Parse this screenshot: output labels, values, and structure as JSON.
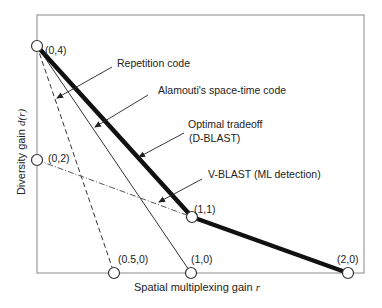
{
  "diagram": {
    "title": "",
    "x_axis_label": "Spatial multiplexing gain ",
    "x_axis_var": "r",
    "y_axis_label": "Diversity gain ",
    "y_axis_var": "d(r)",
    "points": [
      {
        "id": "p04",
        "label": "(0,4)"
      },
      {
        "id": "p02",
        "label": "(0,2)"
      },
      {
        "id": "p050",
        "label": "(0.5,0)"
      },
      {
        "id": "p10",
        "label": "(1,0)"
      },
      {
        "id": "p11",
        "label": "(1,1)"
      },
      {
        "id": "p20",
        "label": "(2,0)"
      }
    ],
    "curves": [
      {
        "name": "Repetition code",
        "style": "dashed",
        "from": "(0,4)",
        "to": "(0.5,0)"
      },
      {
        "name": "Alamouti's space-time code",
        "style": "thin-solid",
        "from": "(0,4)",
        "to": "(1,0)"
      },
      {
        "name": "Optimal tradeoff",
        "sublabel": "(D-BLAST)",
        "style": "thick-solid",
        "path": [
          "(0,4)",
          "(1,1)",
          "(2,0)"
        ]
      },
      {
        "name": "V-BLAST (ML detection)",
        "style": "dash-dot",
        "from": "(0,2)",
        "to": "(1,1)"
      }
    ],
    "annotations": {
      "repetition": "Repetition code",
      "alamouti": "Alamouti's space-time code",
      "optimal_line1": "Optimal tradeoff",
      "optimal_line2": "(D-BLAST)",
      "vblast": "V-BLAST (ML detection)"
    },
    "colors": {
      "frame": "#777777",
      "curve": "#111111",
      "text": "#222222"
    }
  }
}
